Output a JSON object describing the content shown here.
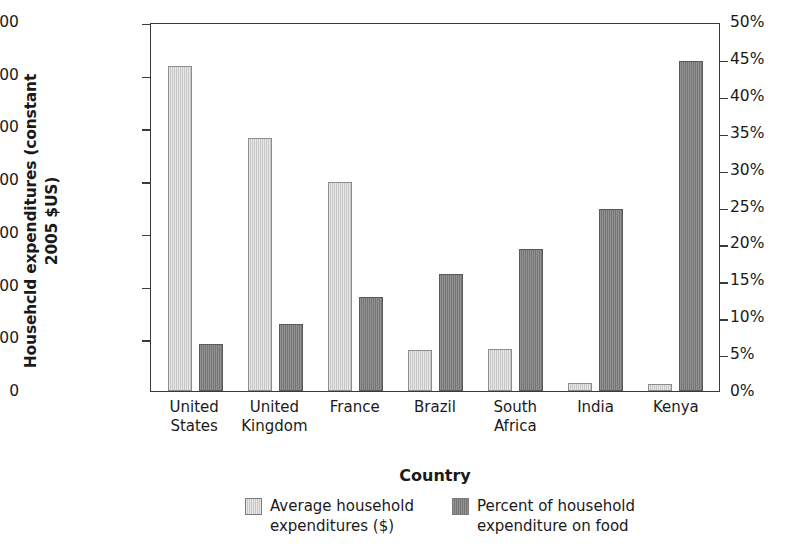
{
  "chart_data": {
    "type": "bar",
    "title": "",
    "xlabel": "Country",
    "ylabel": "Househcld expenditures\n(constant 2005 $US)",
    "y2label": "",
    "grid": false,
    "legend_position": "bottom",
    "categories": [
      "United\nStates",
      "United\nKingdom",
      "France",
      "Brazil",
      "South\nAfrica",
      "India",
      "Kenya"
    ],
    "ylim": [
      0,
      35000
    ],
    "yticks": [
      "0",
      "5,000",
      "10,000",
      "15,000",
      "20,000",
      "25,000",
      "30,000",
      "35,000"
    ],
    "ytick_values": [
      0,
      5000,
      10000,
      15000,
      20000,
      25000,
      30000,
      35000
    ],
    "y2lim": [
      0,
      50
    ],
    "y2ticks": [
      "0%",
      "5%",
      "10%",
      "15%",
      "20%",
      "25%",
      "30%",
      "35%",
      "40%",
      "45%",
      "50%"
    ],
    "y2tick_values": [
      0,
      5,
      10,
      15,
      20,
      25,
      30,
      35,
      40,
      45,
      50
    ],
    "series": [
      {
        "name": "Average household\nexpenditures ($)",
        "axis": "left",
        "color": "#cdcdcd",
        "values": [
          30800,
          24000,
          19800,
          3900,
          4000,
          800,
          650
        ]
      },
      {
        "name": "Percent of household\nexpenditure on food",
        "axis": "right",
        "color": "#7b7b7b",
        "values": [
          6.4,
          9.1,
          12.7,
          15.9,
          19.2,
          24.7,
          44.7
        ]
      }
    ]
  },
  "axis_titles": {
    "y": "Househcld expenditures\n(constant 2005 $US)",
    "x": "Country"
  },
  "legend": {
    "items": [
      {
        "label": "Average household\nexpenditures ($)",
        "swatch": "light-gray-swatch"
      },
      {
        "label": "Percent of household\nexpenditure on food",
        "swatch": "dark-gray-swatch"
      }
    ]
  },
  "colors": {
    "series_light": "#cdcdcd",
    "series_dark": "#7b7b7b",
    "axis": "#3a3a3a",
    "background": "#ffffff"
  }
}
